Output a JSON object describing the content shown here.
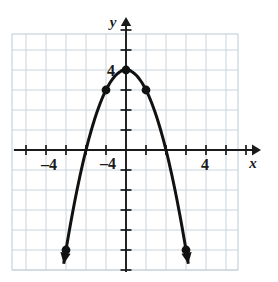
{
  "figure": {
    "background_color": "#ffffff",
    "grid_color": "#c9d4dd",
    "axis_color": "#1a1a1a",
    "curve_color": "#111111"
  },
  "axes": {
    "x_axis_label": "x",
    "y_axis_label": "y",
    "x_tick_labels": [
      {
        "text": "–4",
        "value": -4
      },
      {
        "text": "4",
        "value": 4
      }
    ],
    "y_tick_labels": [
      {
        "text": "4",
        "value": 4
      },
      {
        "text": "–4",
        "value": -4
      }
    ]
  },
  "chart_data": {
    "type": "line",
    "title": "",
    "xlabel": "x",
    "ylabel": "y",
    "xlim": [
      -5.7,
      5.6
    ],
    "ylim": [
      -6.0,
      5.8
    ],
    "grid": true,
    "grid_step": 1,
    "legend": "none",
    "equation": "y = 4 - x^2",
    "series": [
      {
        "name": "parabola",
        "x": [
          -3,
          -2.5,
          -2,
          -1.5,
          -1,
          -0.5,
          0,
          0.5,
          1,
          1.5,
          2,
          2.5,
          3
        ],
        "y": [
          -5,
          -2.25,
          0,
          1.75,
          3,
          3.75,
          4,
          3.75,
          3,
          1.75,
          0,
          -2.25,
          -5
        ],
        "marked_points": [
          {
            "x": -3,
            "y": -5,
            "arrow": "down-left"
          },
          {
            "x": -1,
            "y": 3,
            "arrow": "none"
          },
          {
            "x": 0,
            "y": 4,
            "arrow": "none"
          },
          {
            "x": 1,
            "y": 3,
            "arrow": "none"
          },
          {
            "x": 3,
            "y": -5,
            "arrow": "down-right"
          }
        ]
      }
    ]
  }
}
